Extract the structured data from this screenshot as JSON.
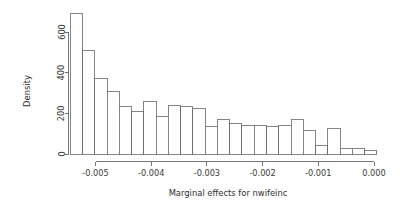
{
  "chart_data": {
    "type": "bar",
    "title": "",
    "subtitle": "",
    "xlabel": "Marginal effects for nwifeinc",
    "ylabel": "Density",
    "xlim": [
      -0.00545,
      5e-05
    ],
    "ylim": [
      0,
      700
    ],
    "grid": false,
    "legend": null,
    "bin_width": 0.00022,
    "x_tick_labels": [
      "-0.005",
      "-0.004",
      "-0.003",
      "-0.002",
      "-0.001",
      "0.000"
    ],
    "x_tick_values": [
      -0.005,
      -0.004,
      -0.003,
      -0.002,
      -0.001,
      0.0
    ],
    "y_tick_labels": [
      "0",
      "200",
      "400",
      "600"
    ],
    "y_tick_values": [
      0,
      200,
      400,
      600
    ],
    "bin_edges": [
      -0.00545,
      -0.00523,
      -0.00501,
      -0.00479,
      -0.00457,
      -0.00435,
      -0.00413,
      -0.00391,
      -0.00369,
      -0.00347,
      -0.00325,
      -0.00303,
      -0.00281,
      -0.00259,
      -0.00237,
      -0.00215,
      -0.00193,
      -0.00171,
      -0.00149,
      -0.00127,
      -0.00105,
      -0.00083,
      -0.00061,
      -0.00039,
      -0.00017,
      5e-05
    ],
    "categories": [
      "-0.00534",
      "-0.00512",
      "-0.00490",
      "-0.00468",
      "-0.00446",
      "-0.00424",
      "-0.00402",
      "-0.00380",
      "-0.00358",
      "-0.00336",
      "-0.00314",
      "-0.00292",
      "-0.00270",
      "-0.00248",
      "-0.00226",
      "-0.00204",
      "-0.00182",
      "-0.00160",
      "-0.00138",
      "-0.00116",
      "-0.00094",
      "-0.00072",
      "-0.00050",
      "-0.00028",
      "-0.00006"
    ],
    "values": [
      693,
      510,
      372,
      305,
      232,
      208,
      258,
      182,
      241,
      233,
      225,
      133,
      169,
      150,
      140,
      139,
      135,
      140,
      169,
      116,
      41,
      126,
      28,
      28,
      15
    ]
  },
  "axis_titles": {
    "x": "Marginal effects for nwifeinc",
    "y": "Density"
  }
}
